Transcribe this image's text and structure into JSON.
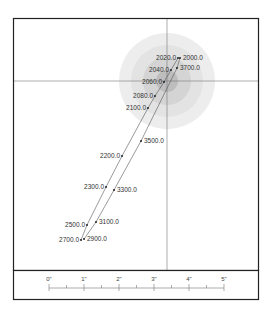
{
  "diagram": {
    "type": "directional-well-plot",
    "crosshair": {
      "x": 167,
      "y": 81
    },
    "target_circles": [
      {
        "r": 48,
        "color": "#ededed"
      },
      {
        "r": 36,
        "color": "#e3e3e3"
      },
      {
        "r": 24,
        "color": "#d4d4d4"
      },
      {
        "r": 11,
        "color": "#bdbdbd"
      }
    ],
    "left_path": [
      {
        "label": "2020.0",
        "x": 178,
        "y": 58,
        "side": "left"
      },
      {
        "label": "2040.0",
        "x": 171,
        "y": 70,
        "side": "left"
      },
      {
        "label": "2060.0",
        "x": 164,
        "y": 82,
        "side": "left"
      },
      {
        "label": "2080.0",
        "x": 155,
        "y": 96,
        "side": "left"
      },
      {
        "label": "2100.0",
        "x": 148,
        "y": 108,
        "side": "left"
      },
      {
        "label": "2200.0",
        "x": 122,
        "y": 156,
        "side": "left"
      },
      {
        "label": "2300.0",
        "x": 106,
        "y": 187,
        "side": "left"
      },
      {
        "label": "2500.0",
        "x": 87,
        "y": 225,
        "side": "left"
      },
      {
        "label": "2700.0",
        "x": 81,
        "y": 240,
        "side": "left"
      }
    ],
    "right_path": [
      {
        "label": "2000.0",
        "x": 180,
        "y": 58,
        "side": "right"
      },
      {
        "label": "3700.0",
        "x": 177,
        "y": 68,
        "side": "right"
      },
      {
        "label": "3500.0",
        "x": 141,
        "y": 141,
        "side": "right"
      },
      {
        "label": "3300.0",
        "x": 114,
        "y": 190,
        "side": "right"
      },
      {
        "label": "3100.0",
        "x": 96,
        "y": 222,
        "side": "right"
      },
      {
        "label": "2900.0",
        "x": 84,
        "y": 239,
        "side": "right"
      }
    ],
    "scale_bar": {
      "labels": [
        "0\"",
        "1\"",
        "2\"",
        "3\"",
        "4\"",
        "5\""
      ],
      "minor_ticks_per_unit": 2
    },
    "colors": {
      "border": "#222222",
      "line": "#555555",
      "point": "#222222"
    }
  }
}
